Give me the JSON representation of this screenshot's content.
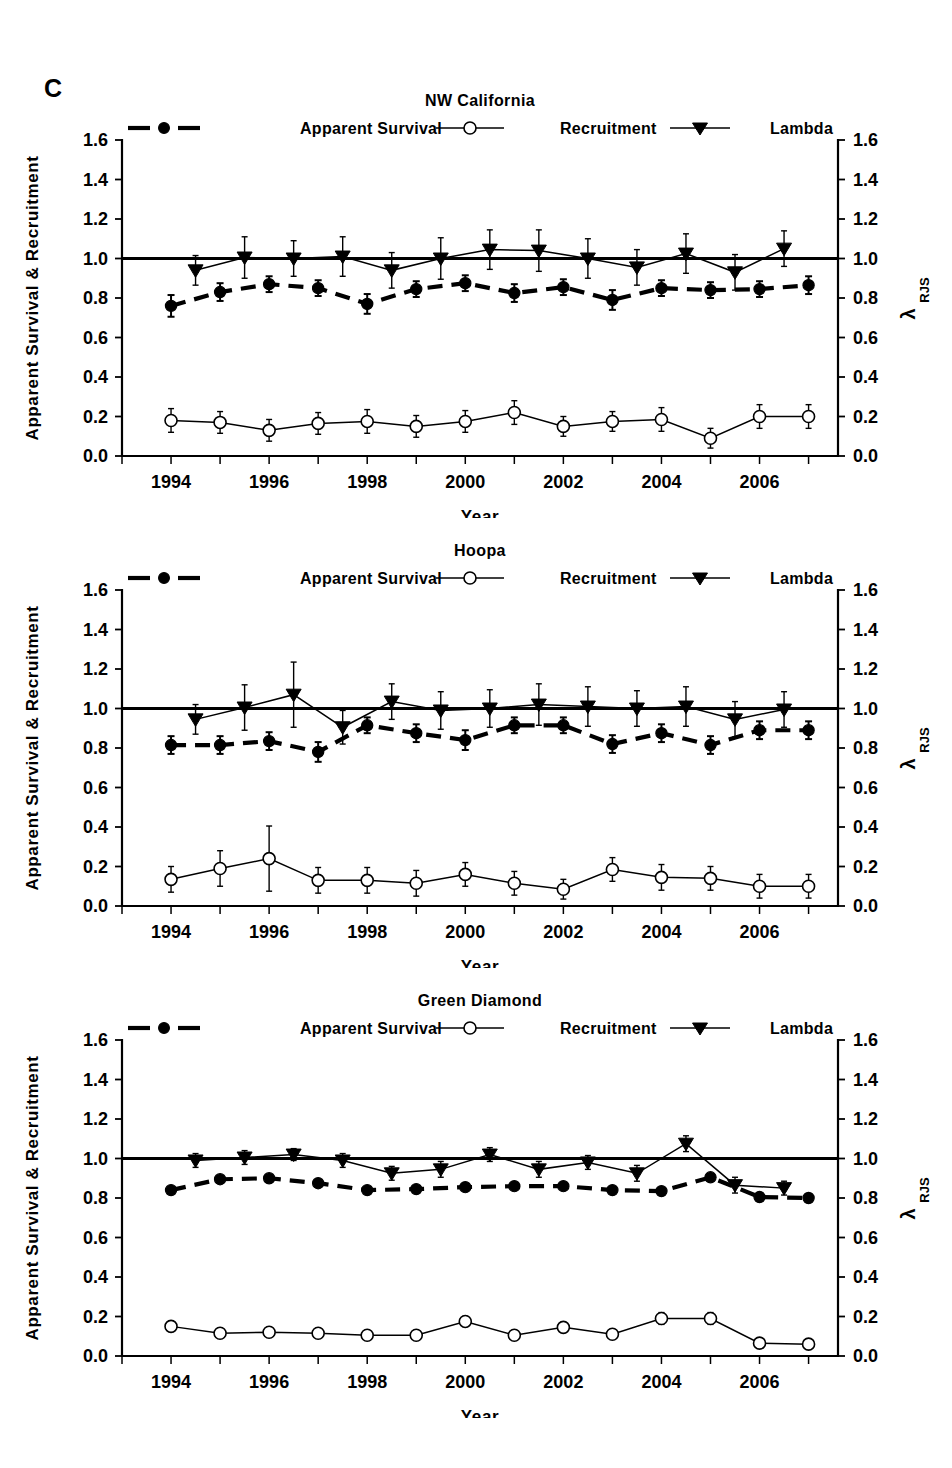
{
  "figure": {
    "panel_label": "C",
    "axis_titles": {
      "y_left": "Apparent Survival & Recruitment",
      "y_right_symbol": "λ",
      "y_right_subscript": "RJS",
      "x": "Year"
    },
    "legend": [
      {
        "label": "Apparent Survival",
        "marker": "filled-circle-dashed-line"
      },
      {
        "label": "Recruitment",
        "marker": "open-circle-solid-line"
      },
      {
        "label": "Lambda",
        "marker": "filled-triangle-down-solid-line"
      }
    ]
  },
  "chart_data": [
    {
      "type": "line",
      "title": "NW California",
      "xlabel": "Year",
      "ylabel": "Apparent Survival & Recruitment",
      "y2label": "λ RJS",
      "xlim": [
        1993.0,
        107.6
      ],
      "ylim": [
        0.0,
        1.6
      ],
      "y2lim": [
        0.0,
        1.6
      ],
      "grid": false,
      "legend_position": "top",
      "reference_line_y": 1.0,
      "xticks_major": [
        1994,
        1996,
        1998,
        2000,
        2002,
        2004,
        2006
      ],
      "yticks": [
        0.0,
        0.2,
        0.4,
        0.6,
        0.8,
        1.0,
        1.2,
        1.4,
        1.6
      ],
      "series": [
        {
          "name": "Apparent Survival",
          "x": [
            1994,
            1995,
            1996,
            1997,
            1998,
            1999,
            2000,
            2001,
            2002,
            2003,
            2004,
            2005,
            2006,
            2007
          ],
          "values": [
            0.76,
            0.83,
            0.87,
            0.85,
            0.77,
            0.845,
            0.875,
            0.825,
            0.855,
            0.79,
            0.85,
            0.84,
            0.845,
            0.865
          ],
          "err_lo": [
            0.055,
            0.045,
            0.04,
            0.04,
            0.05,
            0.04,
            0.04,
            0.045,
            0.04,
            0.05,
            0.04,
            0.04,
            0.04,
            0.045
          ],
          "err_hi": [
            0.055,
            0.045,
            0.04,
            0.04,
            0.05,
            0.04,
            0.04,
            0.045,
            0.04,
            0.05,
            0.04,
            0.04,
            0.04,
            0.045
          ]
        },
        {
          "name": "Recruitment",
          "x": [
            1994,
            1995,
            1996,
            1997,
            1998,
            1999,
            2000,
            2001,
            2002,
            2003,
            2004,
            2005,
            2006,
            2007
          ],
          "values": [
            0.18,
            0.17,
            0.13,
            0.165,
            0.175,
            0.15,
            0.175,
            0.22,
            0.15,
            0.175,
            0.185,
            0.09,
            0.2,
            0.2
          ],
          "err_lo": [
            0.06,
            0.055,
            0.055,
            0.055,
            0.06,
            0.055,
            0.055,
            0.06,
            0.05,
            0.05,
            0.06,
            0.05,
            0.06,
            0.06
          ],
          "err_hi": [
            0.06,
            0.055,
            0.055,
            0.055,
            0.06,
            0.055,
            0.055,
            0.06,
            0.05,
            0.05,
            0.06,
            0.05,
            0.06,
            0.06
          ]
        },
        {
          "name": "Lambda",
          "x": [
            1994.5,
            1995.5,
            1996.5,
            1997.5,
            1998.5,
            1999.5,
            2000.5,
            2001.5,
            2002.5,
            2003.5,
            2004.5,
            2005.5,
            2006.5
          ],
          "values": [
            0.94,
            1.005,
            1.0,
            1.01,
            0.94,
            1.0,
            1.045,
            1.04,
            1.0,
            0.955,
            1.025,
            0.93,
            1.05
          ],
          "err_lo": [
            0.075,
            0.105,
            0.09,
            0.1,
            0.09,
            0.105,
            0.1,
            0.105,
            0.1,
            0.09,
            0.1,
            0.09,
            0.09
          ],
          "err_hi": [
            0.075,
            0.105,
            0.09,
            0.1,
            0.09,
            0.105,
            0.1,
            0.105,
            0.1,
            0.09,
            0.1,
            0.09,
            0.09
          ]
        }
      ]
    },
    {
      "type": "line",
      "title": "Hoopa",
      "xlabel": "Year",
      "ylabel": "Apparent Survival & Recruitment",
      "y2label": "λ RJS",
      "xlim": [
        1993.0,
        2007.6
      ],
      "ylim": [
        0.0,
        1.6
      ],
      "y2lim": [
        0.0,
        1.6
      ],
      "grid": false,
      "legend_position": "top",
      "reference_line_y": 1.0,
      "xticks_major": [
        1994,
        1996,
        1998,
        2000,
        2002,
        2004,
        2006
      ],
      "yticks": [
        0.0,
        0.2,
        0.4,
        0.6,
        0.8,
        1.0,
        1.2,
        1.4,
        1.6
      ],
      "series": [
        {
          "name": "Apparent Survival",
          "x": [
            1994,
            1995,
            1996,
            1997,
            1998,
            1999,
            2000,
            2001,
            2002,
            2003,
            2004,
            2005,
            2006,
            2007
          ],
          "values": [
            0.815,
            0.815,
            0.835,
            0.78,
            0.915,
            0.875,
            0.84,
            0.915,
            0.915,
            0.82,
            0.875,
            0.815,
            0.89,
            0.89
          ],
          "err_lo": [
            0.045,
            0.045,
            0.045,
            0.05,
            0.04,
            0.045,
            0.05,
            0.04,
            0.04,
            0.045,
            0.045,
            0.045,
            0.045,
            0.045
          ],
          "err_hi": [
            0.045,
            0.045,
            0.045,
            0.05,
            0.04,
            0.045,
            0.05,
            0.04,
            0.04,
            0.045,
            0.045,
            0.045,
            0.045,
            0.045
          ]
        },
        {
          "name": "Recruitment",
          "x": [
            1994,
            1995,
            1996,
            1997,
            1998,
            1999,
            2000,
            2001,
            2002,
            2003,
            2004,
            2005,
            2006,
            2007
          ],
          "values": [
            0.135,
            0.19,
            0.24,
            0.13,
            0.13,
            0.115,
            0.16,
            0.115,
            0.085,
            0.185,
            0.145,
            0.14,
            0.1,
            0.1
          ],
          "err_lo": [
            0.065,
            0.09,
            0.165,
            0.065,
            0.065,
            0.065,
            0.06,
            0.06,
            0.05,
            0.06,
            0.065,
            0.06,
            0.06,
            0.06
          ],
          "err_hi": [
            0.065,
            0.09,
            0.165,
            0.065,
            0.065,
            0.065,
            0.06,
            0.06,
            0.05,
            0.06,
            0.065,
            0.06,
            0.06,
            0.06
          ]
        },
        {
          "name": "Lambda",
          "x": [
            1994.5,
            1995.5,
            1996.5,
            1997.5,
            1998.5,
            1999.5,
            2000.5,
            2001.5,
            2002.5,
            2003.5,
            2004.5,
            2005.5,
            2006.5
          ],
          "values": [
            0.945,
            1.005,
            1.07,
            0.905,
            1.035,
            0.99,
            1.0,
            1.02,
            1.01,
            1.0,
            1.01,
            0.945,
            0.995
          ],
          "err_lo": [
            0.075,
            0.115,
            0.165,
            0.085,
            0.09,
            0.095,
            0.095,
            0.105,
            0.1,
            0.09,
            0.1,
            0.09,
            0.09
          ],
          "err_hi": [
            0.075,
            0.115,
            0.165,
            0.085,
            0.09,
            0.095,
            0.095,
            0.105,
            0.1,
            0.09,
            0.1,
            0.09,
            0.09
          ]
        }
      ]
    },
    {
      "type": "line",
      "title": "Green Diamond",
      "xlabel": "Year",
      "ylabel": "Apparent Survival & Recruitment",
      "y2label": "λ RJS",
      "xlim": [
        1993.0,
        2007.6
      ],
      "ylim": [
        0.0,
        1.6
      ],
      "y2lim": [
        0.0,
        1.6
      ],
      "grid": false,
      "legend_position": "top",
      "reference_line_y": 1.0,
      "xticks_major": [
        1994,
        1996,
        1998,
        2000,
        2002,
        2004,
        2006
      ],
      "yticks": [
        0.0,
        0.2,
        0.4,
        0.6,
        0.8,
        1.0,
        1.2,
        1.4,
        1.6
      ],
      "series": [
        {
          "name": "Apparent Survival",
          "x": [
            1994,
            1995,
            1996,
            1997,
            1998,
            1999,
            2000,
            2001,
            2002,
            2003,
            2004,
            2005,
            2006,
            2007
          ],
          "values": [
            0.84,
            0.895,
            0.9,
            0.875,
            0.84,
            0.845,
            0.855,
            0.86,
            0.86,
            0.84,
            0.835,
            0.905,
            0.805,
            0.8
          ],
          "err_lo": [
            0.012,
            0.012,
            0.012,
            0.012,
            0.015,
            0.015,
            0.015,
            0.015,
            0.015,
            0.015,
            0.015,
            0.015,
            0.02,
            0.02
          ],
          "err_hi": [
            0.012,
            0.012,
            0.012,
            0.012,
            0.015,
            0.015,
            0.015,
            0.015,
            0.015,
            0.015,
            0.015,
            0.015,
            0.02,
            0.02
          ]
        },
        {
          "name": "Recruitment",
          "x": [
            1994,
            1995,
            1996,
            1997,
            1998,
            1999,
            2000,
            2001,
            2002,
            2003,
            2004,
            2005,
            2006,
            2007
          ],
          "values": [
            0.15,
            0.115,
            0.12,
            0.115,
            0.105,
            0.105,
            0.175,
            0.105,
            0.145,
            0.11,
            0.19,
            0.19,
            0.065,
            0.06
          ],
          "err_lo": [
            0.025,
            0.02,
            0.02,
            0.02,
            0.02,
            0.02,
            0.025,
            0.02,
            0.025,
            0.02,
            0.03,
            0.03,
            0.02,
            0.02
          ],
          "err_hi": [
            0.025,
            0.02,
            0.02,
            0.02,
            0.02,
            0.02,
            0.025,
            0.02,
            0.025,
            0.02,
            0.03,
            0.03,
            0.02,
            0.02
          ]
        },
        {
          "name": "Lambda",
          "x": [
            1994.5,
            1995.5,
            1996.5,
            1997.5,
            1998.5,
            1999.5,
            2000.5,
            2001.5,
            2002.5,
            2003.5,
            2004.5,
            2005.5,
            2006.5
          ],
          "values": [
            0.99,
            1.005,
            1.02,
            0.99,
            0.925,
            0.945,
            1.02,
            0.945,
            0.98,
            0.925,
            1.075,
            0.865,
            0.85
          ],
          "err_lo": [
            0.035,
            0.035,
            0.03,
            0.035,
            0.035,
            0.04,
            0.035,
            0.04,
            0.035,
            0.04,
            0.04,
            0.04,
            0.035
          ],
          "err_hi": [
            0.035,
            0.035,
            0.03,
            0.035,
            0.035,
            0.04,
            0.035,
            0.04,
            0.035,
            0.04,
            0.04,
            0.04,
            0.035
          ]
        }
      ]
    }
  ]
}
